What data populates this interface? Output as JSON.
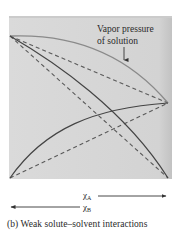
{
  "figure": {
    "annotation": {
      "line1": "Vapor pressure",
      "line2": "of solution"
    },
    "axis": {
      "xa_label": "χ",
      "xa_sub": "A",
      "xb_label": "χ",
      "xb_sub": "B"
    },
    "caption": "(b)  Weak solute–solvent interactions",
    "colors": {
      "panel_background": "#d6d6d6",
      "panel_border": "#c4c4c4",
      "solution_curve": "#8a8a8a",
      "component_curves": "#444444",
      "ideal_dashed": "#5a5a5a"
    }
  }
}
